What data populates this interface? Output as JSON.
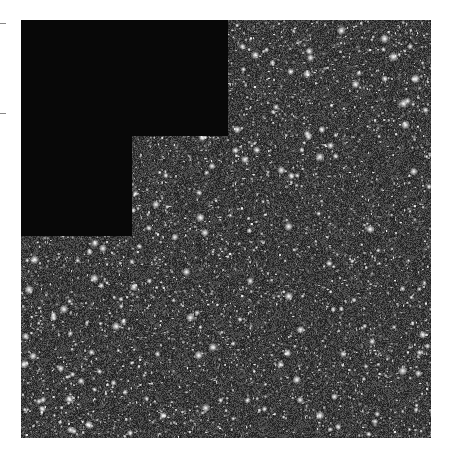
{
  "image": {
    "kind": "astronomical star field (mosaic with missing quadrant)",
    "colors": {
      "background": "#ffffff",
      "field_base": "#3a3a3a",
      "mask": "#080808",
      "star": "#ffffff"
    }
  },
  "ticks": [
    {
      "y": 23
    },
    {
      "y": 113
    }
  ]
}
